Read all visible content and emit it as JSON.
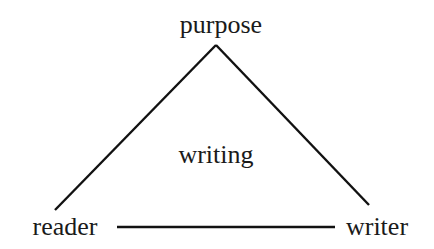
{
  "diagram": {
    "type": "triangle",
    "nodes": {
      "top": "purpose",
      "bottom_left": "reader",
      "bottom_right": "writer",
      "center": "writing"
    },
    "edges": [
      {
        "from": "purpose",
        "to": "reader"
      },
      {
        "from": "purpose",
        "to": "writer"
      },
      {
        "from": "reader",
        "to": "writer"
      }
    ],
    "colors": {
      "line": "#111111",
      "text": "#1a1a1a",
      "background": "#ffffff"
    }
  }
}
